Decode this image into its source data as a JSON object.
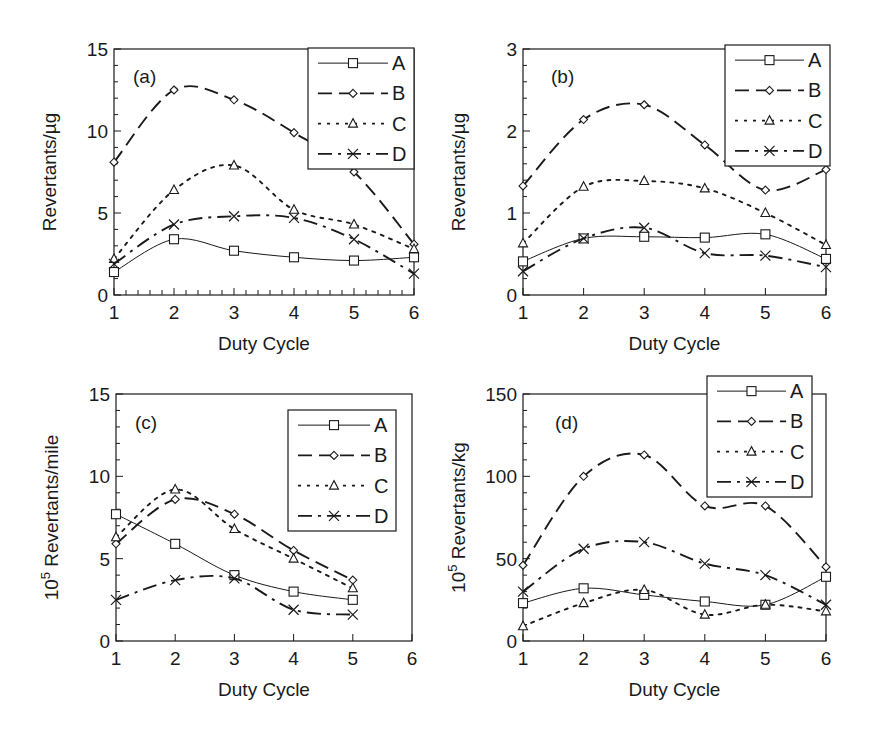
{
  "figure": {
    "panels_count": 4
  },
  "chart_data": [
    {
      "id": "a",
      "type": "line",
      "panel_label": "(a)",
      "xlabel": "Duty Cycle",
      "ylabel": "Revertants/µg",
      "ylabel_sup": "",
      "xlim": [
        1,
        6
      ],
      "ylim": [
        0,
        15
      ],
      "xticks": [
        1,
        2,
        3,
        4,
        5,
        6
      ],
      "yticks": [
        0,
        5,
        10,
        15
      ],
      "y_minor_step": 1,
      "x_minor_step": 0.2,
      "grid": false,
      "legend_position": "upper-right",
      "x": [
        1,
        2,
        3,
        4,
        5,
        6
      ],
      "series": [
        {
          "name": "A",
          "marker": "square",
          "dash": "solid",
          "values": [
            1.4,
            3.4,
            2.7,
            2.3,
            2.1,
            2.3
          ]
        },
        {
          "name": "B",
          "marker": "diamond",
          "dash": "long-dash",
          "values": [
            8.1,
            12.5,
            11.9,
            9.9,
            7.5,
            3.1
          ]
        },
        {
          "name": "C",
          "marker": "triangle",
          "dash": "dotted",
          "values": [
            2.2,
            6.4,
            7.9,
            5.2,
            4.3,
            2.8
          ]
        },
        {
          "name": "D",
          "marker": "x",
          "dash": "dash-dot",
          "values": [
            1.9,
            4.3,
            4.8,
            4.7,
            3.4,
            1.3
          ]
        }
      ],
      "geometry": {
        "left": 114,
        "top": 49,
        "right": 414,
        "bottom": 295,
        "legend": {
          "left": 308,
          "top": 48,
          "right": 414,
          "bottom": 169
        },
        "label_pos": [
          133,
          83
        ]
      }
    },
    {
      "id": "b",
      "type": "line",
      "panel_label": "(b)",
      "xlabel": "Duty Cycle",
      "ylabel": "Revertants/µg",
      "ylabel_sup": "",
      "xlim": [
        1,
        6
      ],
      "ylim": [
        0,
        3
      ],
      "xticks": [
        1,
        2,
        3,
        4,
        5,
        6
      ],
      "yticks": [
        0,
        1,
        2,
        3
      ],
      "y_minor_step": 0.2,
      "x_minor_step": 1,
      "grid": false,
      "legend_position": "upper-right",
      "x": [
        1,
        2,
        3,
        4,
        5,
        6
      ],
      "series": [
        {
          "name": "A",
          "marker": "square",
          "dash": "solid",
          "values": [
            0.41,
            0.69,
            0.71,
            0.7,
            0.74,
            0.44
          ]
        },
        {
          "name": "B",
          "marker": "diamond",
          "dash": "long-dash",
          "values": [
            1.33,
            2.14,
            2.32,
            1.83,
            1.28,
            1.53
          ]
        },
        {
          "name": "C",
          "marker": "triangle",
          "dash": "dotted",
          "values": [
            0.63,
            1.32,
            1.39,
            1.3,
            1.0,
            0.61
          ]
        },
        {
          "name": "D",
          "marker": "x",
          "dash": "dash-dot",
          "values": [
            0.29,
            0.69,
            0.82,
            0.51,
            0.48,
            0.34
          ]
        }
      ],
      "geometry": {
        "left": 523,
        "top": 49,
        "right": 826,
        "bottom": 295,
        "legend": {
          "left": 725,
          "top": 45,
          "right": 830,
          "bottom": 166
        },
        "label_pos": [
          551,
          83
        ]
      }
    },
    {
      "id": "c",
      "type": "line",
      "panel_label": "(c)",
      "xlabel": "Duty Cycle",
      "ylabel": " Revertants/mile",
      "ylabel_base": "10",
      "ylabel_sup": "5",
      "xlim": [
        1,
        6
      ],
      "ylim": [
        0,
        15
      ],
      "xticks": [
        1,
        2,
        3,
        4,
        5,
        6
      ],
      "yticks": [
        0,
        5,
        10,
        15
      ],
      "y_minor_step": 1,
      "x_minor_step": 1,
      "grid": false,
      "legend_position": "upper-right",
      "x": [
        1,
        2,
        3,
        4,
        5
      ],
      "series": [
        {
          "name": "A",
          "marker": "square",
          "dash": "solid",
          "values": [
            7.7,
            5.9,
            4.0,
            3.0,
            2.5
          ]
        },
        {
          "name": "B",
          "marker": "diamond",
          "dash": "long-dash",
          "values": [
            5.9,
            8.6,
            7.7,
            5.5,
            3.7
          ]
        },
        {
          "name": "C",
          "marker": "triangle",
          "dash": "dotted",
          "values": [
            6.3,
            9.2,
            6.8,
            5.0,
            3.2
          ]
        },
        {
          "name": "D",
          "marker": "x",
          "dash": "dash-dot",
          "values": [
            2.5,
            3.7,
            3.8,
            1.9,
            1.6
          ]
        }
      ],
      "geometry": {
        "left": 116,
        "top": 394,
        "right": 412,
        "bottom": 641,
        "legend": {
          "left": 288,
          "top": 410,
          "right": 396,
          "bottom": 531
        },
        "label_pos": [
          135,
          429
        ]
      }
    },
    {
      "id": "d",
      "type": "line",
      "panel_label": "(d)",
      "xlabel": "Duty Cycle",
      "ylabel": " Revertants/kg",
      "ylabel_base": "10",
      "ylabel_sup": "5",
      "xlim": [
        1,
        6
      ],
      "ylim": [
        0,
        150
      ],
      "xticks": [
        1,
        2,
        3,
        4,
        5,
        6
      ],
      "yticks": [
        0,
        50,
        100,
        150
      ],
      "y_minor_step": 10,
      "x_minor_step": 1,
      "grid": false,
      "legend_position": "upper-right",
      "x": [
        1,
        2,
        3,
        4,
        5,
        6
      ],
      "series": [
        {
          "name": "A",
          "marker": "square",
          "dash": "solid",
          "values": [
            23,
            32,
            28,
            24,
            22,
            39
          ]
        },
        {
          "name": "B",
          "marker": "diamond",
          "dash": "long-dash",
          "values": [
            46,
            100,
            113,
            82,
            82,
            45
          ]
        },
        {
          "name": "C",
          "marker": "triangle",
          "dash": "dotted",
          "values": [
            9,
            23,
            31,
            16,
            22,
            18
          ]
        },
        {
          "name": "D",
          "marker": "x",
          "dash": "dash-dot",
          "values": [
            30,
            56,
            60,
            47,
            40,
            22
          ]
        }
      ],
      "geometry": {
        "left": 523,
        "top": 394,
        "right": 826,
        "bottom": 641,
        "legend": {
          "left": 707,
          "top": 376,
          "right": 812,
          "bottom": 497
        },
        "label_pos": [
          555,
          429
        ]
      }
    }
  ],
  "style": {
    "ink": "#1a1a1a",
    "background": "#ffffff",
    "dash_patterns": {
      "solid": "",
      "long-dash": "14,7",
      "dotted": "3,6",
      "dash-dot": "14,6,3,6"
    }
  }
}
